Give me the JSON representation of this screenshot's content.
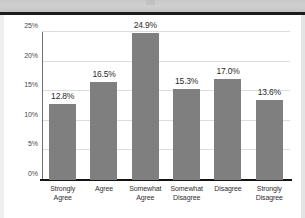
{
  "page": {
    "background_color": "#ffffff",
    "scan_band_color": "#cbcbcb",
    "rule_color": "#1c1c1c"
  },
  "chart_data": {
    "type": "bar",
    "title": "",
    "subtitle": "",
    "xlabel": "",
    "ylabel": "",
    "categories": [
      "Strongly Agree",
      "Agree",
      "Somewhat Agree",
      "Somewhat Disagree",
      "Disagree",
      "Strongly Disagree"
    ],
    "category_lines": [
      [
        "Strongly",
        "Agree"
      ],
      [
        "Agree",
        ""
      ],
      [
        "Somewhat",
        "Agree"
      ],
      [
        "Somewhat",
        "Disagree"
      ],
      [
        "Disagree",
        ""
      ],
      [
        "Strongly",
        "Disagree"
      ]
    ],
    "values": [
      12.8,
      16.5,
      24.9,
      15.3,
      17.0,
      13.6
    ],
    "data_labels": [
      "12.8%",
      "16.5%",
      "24.9%",
      "15.3%",
      "17.0%",
      "13.6%"
    ],
    "ylim": [
      0,
      25
    ],
    "yticks": [
      0,
      5,
      10,
      15,
      20,
      25
    ],
    "ytick_labels": [
      "0%",
      "5%",
      "10%",
      "15%",
      "20%",
      "25%"
    ],
    "grid": true,
    "grid_axis": "y",
    "legend": false,
    "legend_position": "none",
    "bar_color": "#7f7f7f",
    "grid_color": "#dcdcdc",
    "axis_color": "#141414",
    "label_color": "#2b2b2b"
  }
}
